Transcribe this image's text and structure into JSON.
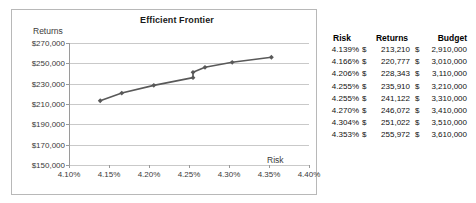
{
  "chart_data": {
    "type": "line",
    "title": "Efficient Frontier",
    "xlabel": "Risk",
    "ylabel": "Returns",
    "xlim": [
      4.1,
      4.4
    ],
    "ylim": [
      150000,
      270000
    ],
    "ytick_labels": [
      "$270,000",
      "$250,000",
      "$230,000",
      "$210,000",
      "$190,000",
      "$170,000",
      "$150,000"
    ],
    "ytick_values": [
      270000,
      250000,
      230000,
      210000,
      190000,
      170000,
      150000
    ],
    "xtick_labels": [
      "4.10%",
      "4.15%",
      "4.20%",
      "4.25%",
      "4.30%",
      "4.35%",
      "4.40%"
    ],
    "xtick_values": [
      4.1,
      4.15,
      4.2,
      4.25,
      4.3,
      4.35,
      4.4
    ],
    "grid": true,
    "legend": "none",
    "marker": "diamond",
    "series": [
      {
        "name": "Efficient Frontier",
        "color": "#595959",
        "x": [
          4.139,
          4.166,
          4.206,
          4.255,
          4.255,
          4.27,
          4.304,
          4.353
        ],
        "y": [
          213210,
          220777,
          228343,
          235910,
          241122,
          246072,
          251022,
          255972
        ]
      }
    ]
  },
  "table": {
    "headers": [
      "Risk",
      "Returns",
      "Budget"
    ],
    "currency_symbol": "$",
    "rows": [
      {
        "risk": "4.139%",
        "returns": "213,210",
        "budget": "2,910,000"
      },
      {
        "risk": "4.166%",
        "returns": "220,777",
        "budget": "3,010,000"
      },
      {
        "risk": "4.206%",
        "returns": "228,343",
        "budget": "3,110,000"
      },
      {
        "risk": "4.255%",
        "returns": "235,910",
        "budget": "3,210,000"
      },
      {
        "risk": "4.255%",
        "returns": "241,122",
        "budget": "3,310,000"
      },
      {
        "risk": "4.270%",
        "returns": "246,072",
        "budget": "3,410,000"
      },
      {
        "risk": "4.304%",
        "returns": "251,022",
        "budget": "3,510,000"
      },
      {
        "risk": "4.353%",
        "returns": "255,972",
        "budget": "3,610,000"
      }
    ]
  },
  "colors": {
    "series": "#595959",
    "gridline": "#c9c9c9",
    "axis": "#9a9a9a",
    "chart_border": "#b8b8b8",
    "text": "#3a3a3a"
  }
}
